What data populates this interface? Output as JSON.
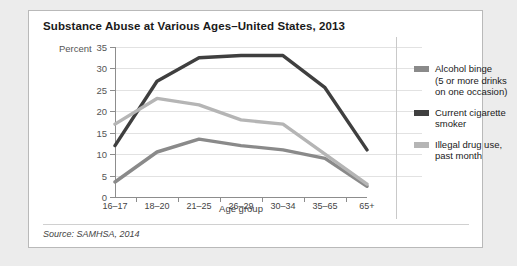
{
  "card": {
    "title": "Substance Abuse at Various Ages–United States, 2013",
    "source": "Source: SAMHSA, 2014"
  },
  "chart_data": {
    "type": "line",
    "title": "Substance Abuse at Various Ages–United States, 2013",
    "xlabel": "Age group",
    "ylabel": "Percent",
    "categories": [
      "16–17",
      "18–20",
      "21–25",
      "26–29",
      "30–34",
      "35–65",
      "65+"
    ],
    "ylim": [
      0,
      35
    ],
    "yticks": [
      0,
      5,
      10,
      15,
      20,
      25,
      30,
      35
    ],
    "grid": true,
    "legend_position": "right",
    "series": [
      {
        "name": "Alcohol binge (5 or more drinks on one occasion)",
        "legend_label": "Alcohol binge\n(5 or more drinks\non one occasion)",
        "color": "#8a8a8a",
        "values": [
          3.5,
          10.5,
          13.5,
          12.0,
          11.0,
          9.0,
          2.5
        ]
      },
      {
        "name": "Current cigarette smoker",
        "legend_label": "Current cigarette\nsmoker",
        "color": "#3f3f3f",
        "values": [
          12.0,
          27.0,
          32.5,
          33.0,
          33.0,
          25.5,
          11.0
        ]
      },
      {
        "name": "Illegal drug use, past month",
        "legend_label": "Illegal drug use,\npast month",
        "color": "#b5b5b5",
        "values": [
          17.0,
          23.0,
          21.5,
          18.0,
          17.0,
          10.0,
          3.0
        ]
      }
    ]
  },
  "legend": {
    "items": [
      {
        "line1": "Alcohol binge",
        "line2": "(5 or more drinks",
        "line3": "on one occasion)"
      },
      {
        "line1": "Current cigarette",
        "line2": "smoker",
        "line3": ""
      },
      {
        "line1": "Illegal drug use,",
        "line2": "past month",
        "line3": ""
      }
    ]
  },
  "axis": {
    "percent_caption": "Percent",
    "x_title": "Age group",
    "yticks": [
      "35",
      "30",
      "25",
      "20",
      "15",
      "10",
      "5",
      "0"
    ],
    "xticks": [
      "16–17",
      "18–20",
      "21–25",
      "26–29",
      "30–34",
      "35–65",
      "65+"
    ]
  }
}
